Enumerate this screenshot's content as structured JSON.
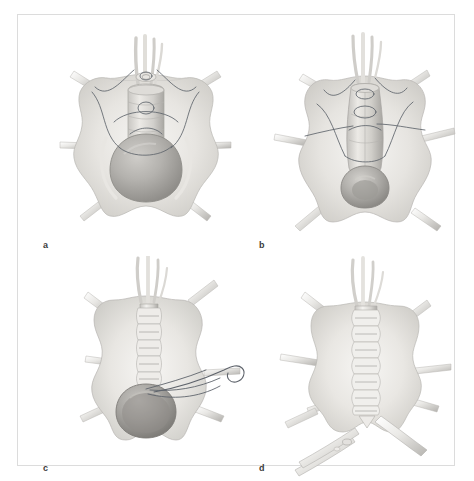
{
  "figure": {
    "kind": "surgical-illustration-plate",
    "panel_count": 4,
    "background_color": "#ffffff",
    "frame_color": "#dcdcdc",
    "label_color": "#3b3b3b",
    "ink_color": "#5a5f68",
    "tissue_light": "#f2f1ef",
    "tissue_mid": "#d9d7d3",
    "tissue_shadow": "#a9a7a3",
    "lumen_dark": "#8e8c89",
    "instrument_color": "#e6e6e4"
  },
  "panels": [
    {
      "id": "a",
      "label": "a",
      "caption_letter": "a",
      "description": "Open dural sac retracted by six stay sutures; a large rounded lesion is exposed within the opened dura, with fine suture threads arcing across the upper field.",
      "stay_suture_count": 6,
      "lesion_visible": true,
      "sutures_placed": false,
      "needle_visible": false,
      "instrument_visible": false
    },
    {
      "id": "b",
      "label": "b",
      "caption_letter": "b",
      "description": "Dural edges drawn closer together; the lesion has been reduced and the opening narrowed, with suture threads fanning out to the retraction points.",
      "stay_suture_count": 6,
      "lesion_visible": true,
      "sutures_placed": false,
      "needle_visible": false,
      "instrument_visible": false
    },
    {
      "id": "c",
      "label": "c",
      "caption_letter": "c",
      "description": "Running suture closure advanced from cranial to caudal; a curved needle with two trailing suture limbs is drawn to the right, the residual lesion remains at the caudal end.",
      "stay_suture_count": 6,
      "lesion_visible": true,
      "sutures_placed": true,
      "needle_visible": true,
      "instrument_visible": false
    },
    {
      "id": "d",
      "label": "d",
      "caption_letter": "d",
      "description": "Completed watertight dural closure with a continuous running suture along the full length; a surgical forceps enters from the lower right holding the final knot.",
      "stay_suture_count": 6,
      "lesion_visible": false,
      "sutures_placed": true,
      "needle_visible": false,
      "instrument_visible": true
    }
  ]
}
